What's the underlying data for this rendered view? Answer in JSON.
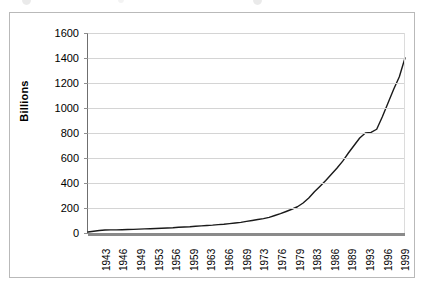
{
  "chart_data": {
    "type": "line",
    "title": "",
    "xlabel": "",
    "ylabel": "Billions",
    "ylim": [
      0,
      1600
    ],
    "y_ticks": [
      1600,
      1400,
      1200,
      1000,
      800,
      600,
      400,
      200,
      0
    ],
    "grid": true,
    "legend": "none",
    "line_color": "#1a1a1a",
    "gridline_color": "#d4d4d4",
    "axis_color": "#6f6f6f",
    "x_tick_labels": [
      "1943",
      "1946",
      "1949",
      "1953",
      "1956",
      "1959",
      "1963",
      "1966",
      "1969",
      "1973",
      "1976",
      "1979",
      "1983",
      "1986",
      "1989",
      "1993",
      "1996",
      "1999"
    ],
    "categories": [
      "1943",
      "1944",
      "1945",
      "1946",
      "1947",
      "1948",
      "1949",
      "1950",
      "1951",
      "1952",
      "1953",
      "1954",
      "1955",
      "1956",
      "1957",
      "1958",
      "1959",
      "1960",
      "1961",
      "1962",
      "1963",
      "1964",
      "1965",
      "1966",
      "1967",
      "1968",
      "1969",
      "1970",
      "1971",
      "1972",
      "1973",
      "1974",
      "1975",
      "1976",
      "1977",
      "1978",
      "1979",
      "1980",
      "1981",
      "1982",
      "1983",
      "1984",
      "1985",
      "1986",
      "1987",
      "1988",
      "1989",
      "1990",
      "1991",
      "1992",
      "1993",
      "1994",
      "1995",
      "1996",
      "1997",
      "1998",
      "1999"
    ],
    "values": [
      8,
      14,
      20,
      24,
      25,
      25,
      26,
      28,
      29,
      31,
      33,
      34,
      36,
      38,
      40,
      42,
      46,
      48,
      50,
      54,
      57,
      60,
      63,
      67,
      70,
      75,
      80,
      85,
      93,
      100,
      108,
      115,
      125,
      140,
      155,
      172,
      190,
      210,
      240,
      280,
      330,
      375,
      420,
      470,
      520,
      575,
      640,
      700,
      760,
      800,
      805,
      830,
      930,
      1040,
      1150,
      1250,
      1400
    ]
  }
}
